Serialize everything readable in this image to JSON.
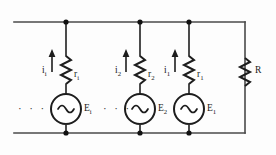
{
  "diagram": {
    "type": "electrical-schematic",
    "colors": {
      "wire": "#4a4a4a",
      "component": "#1d1d1d",
      "node": "#111111",
      "background": "#fdfdfd"
    },
    "rails": {
      "top_y": 22,
      "bottom_y": 133,
      "left_x": 14,
      "right_x": 245
    },
    "branches": [
      {
        "id": "branch-i",
        "x": 66,
        "current_label": "i",
        "current_sub": "i",
        "current_direction": "up",
        "resistor_label": "r",
        "resistor_sub": "i",
        "source_label": "E",
        "source_sub": "i",
        "source_type": "ac",
        "node_dots": true
      },
      {
        "id": "branch-2",
        "x": 140,
        "current_label": "i",
        "current_sub": "2",
        "current_direction": "up",
        "resistor_label": "r",
        "resistor_sub": "2",
        "source_label": "E",
        "source_sub": "2",
        "source_type": "ac",
        "node_dots": true
      },
      {
        "id": "branch-1",
        "x": 189,
        "current_label": "i",
        "current_sub": "1",
        "current_direction": "up",
        "resistor_label": "r",
        "resistor_sub": "1",
        "source_label": "E",
        "source_sub": "1",
        "source_type": "ac",
        "node_dots": true
      }
    ],
    "load": {
      "id": "load-resistor",
      "x": 245,
      "label": "R",
      "sub": ""
    },
    "ellipses": [
      {
        "id": "ellipsis-left",
        "text": "· · ·",
        "x": 18,
        "y": 103
      },
      {
        "id": "ellipsis-mid",
        "text": "· · ·",
        "x": 93,
        "y": 103
      }
    ]
  }
}
